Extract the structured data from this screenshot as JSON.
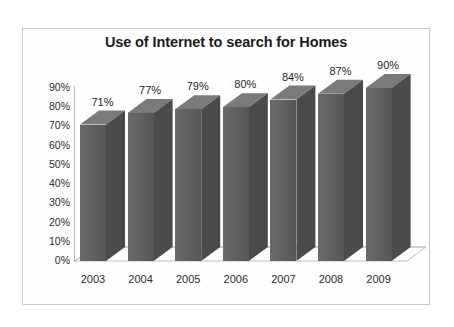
{
  "chart_data": {
    "type": "bar",
    "title": "Use of Internet to search for Homes",
    "categories": [
      "2003",
      "2004",
      "2005",
      "2006",
      "2007",
      "2008",
      "2009"
    ],
    "values": [
      71,
      77,
      79,
      80,
      84,
      87,
      90
    ],
    "data_labels": [
      "71%",
      "77%",
      "79%",
      "80%",
      "84%",
      "87%",
      "90%"
    ],
    "xlabel": "",
    "ylabel": "",
    "ylim": [
      0,
      90
    ],
    "ytick_step": 10,
    "ytick_labels": [
      "90%",
      "80%",
      "70%",
      "60%",
      "50%",
      "40%",
      "30%",
      "20%",
      "10%",
      "0%"
    ],
    "ytick_values": [
      90,
      80,
      70,
      60,
      50,
      40,
      30,
      20,
      10,
      0
    ],
    "grid": false,
    "legend": false,
    "legend_position": "none",
    "style": "3d-column",
    "series": [
      {
        "name": "Use of Internet to search for Homes",
        "values": [
          71,
          77,
          79,
          80,
          84,
          87,
          90
        ]
      }
    ],
    "colors": {
      "bar_front": "#636363",
      "bar_side": "#4a4a4a",
      "bar_top": "#7a7a7a",
      "axis": "#b8b8b8",
      "text": "#1f1f1f",
      "background": "#ffffff",
      "frame": "#c9c9c9"
    }
  }
}
